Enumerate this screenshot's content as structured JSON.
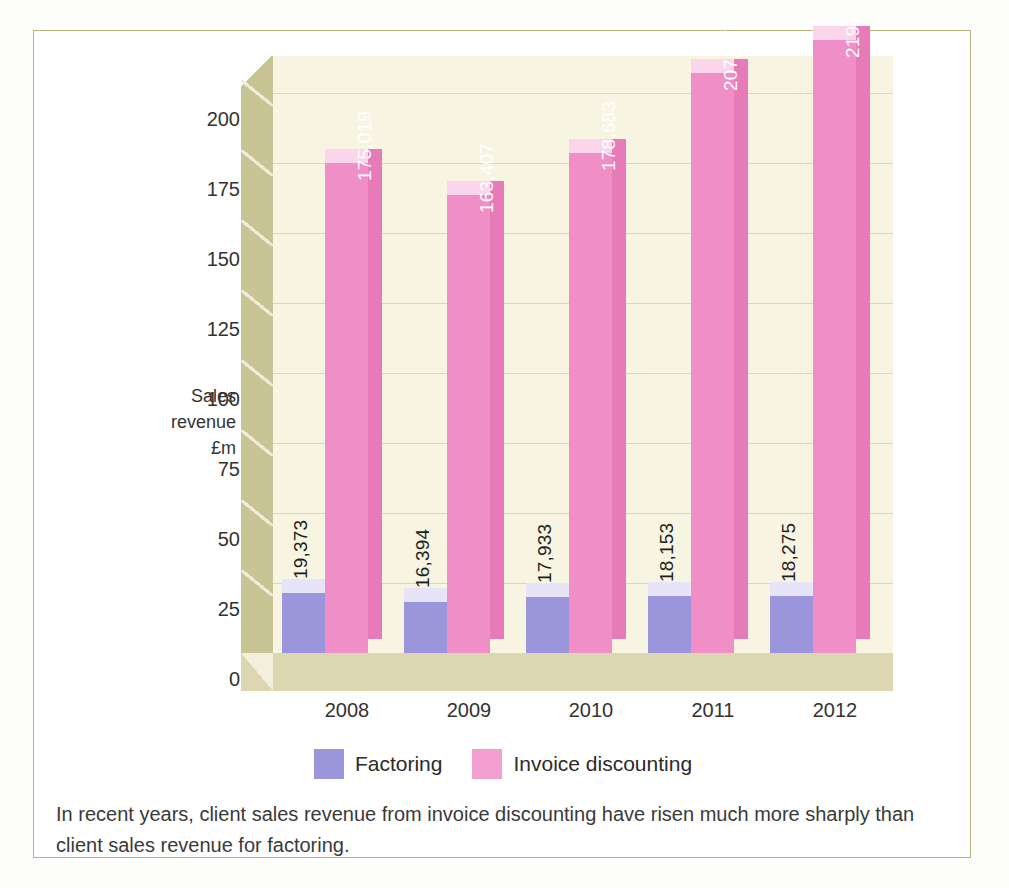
{
  "chart_data": {
    "type": "bar",
    "title": "",
    "subtitle": "",
    "xlabel": "",
    "ylabel": "Sales revenue £m",
    "ylabel_lines": [
      "Sales",
      "revenue",
      "£m"
    ],
    "categories": [
      "2008",
      "2009",
      "2010",
      "2011",
      "2012"
    ],
    "ylim": [
      0,
      200
    ],
    "yticks": [
      0,
      25,
      50,
      75,
      100,
      125,
      150,
      175,
      200
    ],
    "ytick_labels": [
      "0",
      "25",
      "50",
      "75",
      "100",
      "125",
      "150",
      "175",
      "200"
    ],
    "grid": true,
    "legend_position": "bottom",
    "style": "3d-column",
    "series": [
      {
        "name": "Factoring",
        "color": "#9b96dc",
        "values": [
          19373,
          16394,
          17933,
          18153,
          18275
        ],
        "data_labels": [
          "19,373",
          "16,394",
          "17,933",
          "18,153",
          "18,275"
        ],
        "plotted_heights": [
          21.5,
          18.2,
          19.9,
          20.2,
          20.3
        ]
      },
      {
        "name": "Invoice discounting",
        "color": "#f08ec8",
        "values": [
          175019,
          163407,
          178683,
          207157,
          219059
        ],
        "data_labels": [
          "175,019",
          "163,407",
          "178,683",
          "207,157",
          "219,059"
        ],
        "plotted_heights": [
          175.0,
          163.4,
          178.7,
          207.2,
          219.1
        ]
      }
    ],
    "annotations": [
      "In recent years, client sales revenue from invoice discounting have risen much more sharply than client sales revenue for factoring."
    ]
  },
  "legend": {
    "items": [
      {
        "label": "Factoring",
        "color": "#9b96dc"
      },
      {
        "label": "Invoice discounting",
        "color": "#f3a0d1"
      }
    ]
  },
  "caption": {
    "text": "In recent years, client sales revenue from invoice discounting have risen much more sharply than client sales revenue for factoring."
  },
  "colors": {
    "factoring": "#9b96dc",
    "invoice_discounting": "#f08ec8",
    "plot_background": "#f7f5e2",
    "side_wall": "#c9c493",
    "floor": "#dcd7b0",
    "frame_border": "#b9b47e"
  }
}
